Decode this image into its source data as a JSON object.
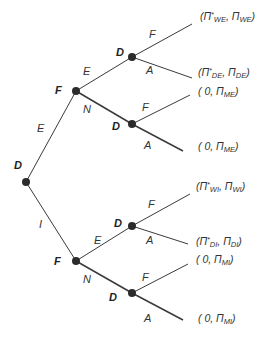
{
  "diagram": {
    "type": "game-tree",
    "colors": {
      "line": "#3a3a3a",
      "node": "#2b2b2b",
      "text": "#333333"
    },
    "nodes": [
      {
        "id": "root",
        "player": "D",
        "x": 26,
        "y": 182
      },
      {
        "id": "f_upper",
        "player": "F",
        "x": 76,
        "y": 91
      },
      {
        "id": "d_upper_e",
        "player": "D",
        "x": 132,
        "y": 57
      },
      {
        "id": "d_upper_n",
        "player": "D",
        "x": 132,
        "y": 124
      },
      {
        "id": "f_lower",
        "player": "F",
        "x": 76,
        "y": 261
      },
      {
        "id": "d_lower_e",
        "player": "D",
        "x": 132,
        "y": 226
      },
      {
        "id": "d_lower_n",
        "player": "D",
        "x": 132,
        "y": 293
      }
    ],
    "edges": [
      {
        "from": "root",
        "to": "f_upper",
        "label": "E"
      },
      {
        "from": "root",
        "to": "f_lower",
        "label": "I"
      },
      {
        "from": "f_upper",
        "to": "d_upper_e",
        "label": "E"
      },
      {
        "from": "f_upper",
        "to": "d_upper_n",
        "label": "N"
      },
      {
        "from": "f_lower",
        "to": "d_lower_e",
        "label": "E"
      },
      {
        "from": "f_lower",
        "to": "d_lower_n",
        "label": "N"
      },
      {
        "from": "d_upper_e",
        "to": "t1",
        "label": "F"
      },
      {
        "from": "d_upper_e",
        "to": "t2",
        "label": "A"
      },
      {
        "from": "d_upper_n",
        "to": "t3",
        "label": "F"
      },
      {
        "from": "d_upper_n",
        "to": "t4",
        "label": "A"
      },
      {
        "from": "d_lower_e",
        "to": "t5",
        "label": "F"
      },
      {
        "from": "d_lower_e",
        "to": "t6",
        "label": "A"
      },
      {
        "from": "d_lower_n",
        "to": "t7",
        "label": "F"
      },
      {
        "from": "d_lower_n",
        "to": "t8",
        "label": "A"
      }
    ],
    "players": {
      "root": "D",
      "f_upper": "F",
      "d_upper_e": "D",
      "d_upper_n": "D",
      "f_lower": "F",
      "d_lower_e": "D",
      "d_lower_n": "D"
    },
    "edge_labels": {
      "root_e": "E",
      "root_i": "I",
      "fu_e": "E",
      "fu_n": "N",
      "fl_e": "E",
      "fl_n": "N",
      "due_f": "F",
      "due_a": "A",
      "dun_f": "F",
      "dun_a": "A",
      "dle_f": "F",
      "dle_a": "A",
      "dln_f": "F",
      "dln_a": "A"
    },
    "payoffs": [
      {
        "open": "(",
        "first_sym": "Π",
        "first_star": "*",
        "first_sub": "WE",
        "sep": ", ",
        "second_sym": "Π",
        "second_sub": "WE",
        "close": ")"
      },
      {
        "open": "(",
        "first_sym": "Π",
        "first_star": "*",
        "first_sub": "DE",
        "sep": ", ",
        "second_sym": "Π",
        "second_sub": "DE",
        "close": ")"
      },
      {
        "open": "( ",
        "first_zero": "0",
        "sep": ", ",
        "second_sym": "Π",
        "second_sub": "ME",
        "close": ")"
      },
      {
        "open": "( ",
        "first_zero": "0",
        "sep": ", ",
        "second_sym": "Π",
        "second_sub": "ME",
        "close": ")"
      },
      {
        "open": "(",
        "first_sym": "Π",
        "first_star": "*",
        "first_sub": "WI",
        "sep": ", ",
        "second_sym": "Π",
        "second_sub": "WI",
        "close": ")"
      },
      {
        "open": "(",
        "first_sym": "Π",
        "first_star": "*",
        "first_sub": "DI",
        "sep": ", ",
        "second_sym": "Π",
        "second_sub": "DI",
        "close": ")"
      },
      {
        "open": "( ",
        "first_zero": "0",
        "sep": ", ",
        "second_sym": "Π",
        "second_sub": "MI",
        "close": ")"
      },
      {
        "open": "( ",
        "first_zero": "0",
        "sep": ", ",
        "second_sym": "Π",
        "second_sub": "MI",
        "close": ")"
      }
    ]
  }
}
